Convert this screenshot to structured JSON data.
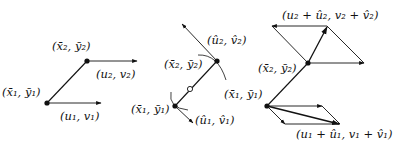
{
  "panels": [
    {
      "id": "panel-1",
      "labels": {
        "p1": "(x̄₁, ȳ₁)",
        "p2": "(x̄₂, ȳ₂)",
        "v1": "(u₁, v₁)",
        "v2": "(u₂, v₂)"
      }
    },
    {
      "id": "panel-2",
      "labels": {
        "p1": "(x̄₁, ȳ₁)",
        "p2": "(x̄₂, ȳ₂)",
        "v1": "(û₁, v̂₁)",
        "v2": "(û₂, v̂₂)"
      }
    },
    {
      "id": "panel-3",
      "labels": {
        "p1": "(x̄₁, ȳ₁)",
        "p2": "(x̄₂, ȳ₂)",
        "s1": "(u₁ + û₁, v₁ + v̂₁)",
        "s2": "(u₂ + û₂, v₂ + v̂₂)"
      }
    }
  ],
  "colors": {
    "stroke": "#111111",
    "background": "#ffffff"
  }
}
